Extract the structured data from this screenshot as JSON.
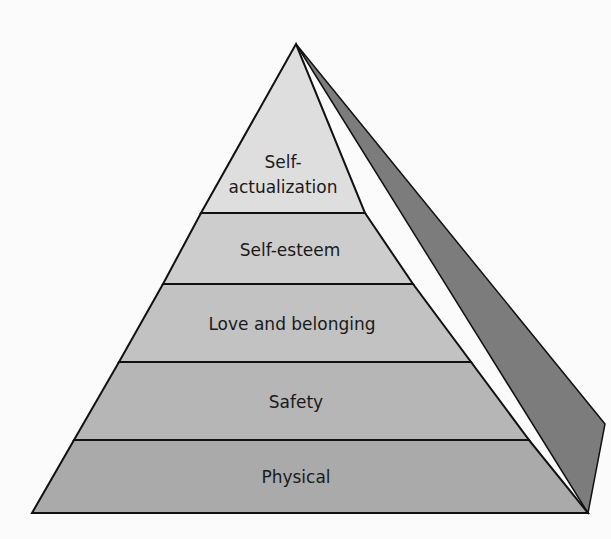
{
  "diagram": {
    "type": "pyramid",
    "colors": {
      "background": "#fbfbfb",
      "side_face": "#7c7c7c",
      "outline": "#111111",
      "text": "#1a1a1a"
    },
    "levels": [
      {
        "label_line1": "Self-",
        "label_line2": "actualization",
        "fill": "#dedede"
      },
      {
        "label": "Self-esteem",
        "fill": "#cdcdcd"
      },
      {
        "label": "Love and belonging",
        "fill": "#c2c2c2"
      },
      {
        "label": "Safety",
        "fill": "#b6b6b6"
      },
      {
        "label": "Physical",
        "fill": "#aaaaaa"
      }
    ]
  }
}
